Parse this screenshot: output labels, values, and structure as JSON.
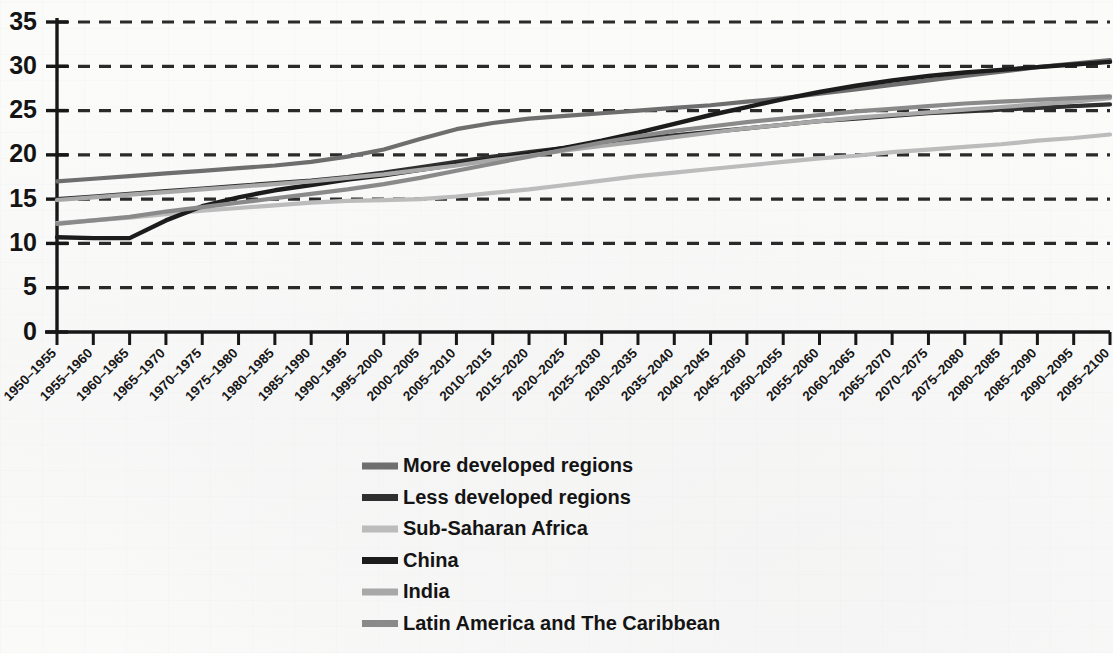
{
  "chart_data": {
    "type": "line",
    "title": "",
    "xlabel": "",
    "ylabel": "",
    "ylim": [
      0,
      35
    ],
    "ytick_step": 5,
    "grid": true,
    "grid_style": "dashed-horizontal",
    "legend_position": "below-plot-center",
    "yticks": [
      "0",
      "5",
      "10",
      "15",
      "20",
      "25",
      "30",
      "35"
    ],
    "categories": [
      "1950–1955",
      "1955–1960",
      "1960–1965",
      "1965–1970",
      "1970–1975",
      "1975–1980",
      "1980–1985",
      "1985–1990",
      "1990–1995",
      "1995–2000",
      "2000–2005",
      "2005–2010",
      "2010–2015",
      "2015–2020",
      "2020–2025",
      "2025–2030",
      "2030–2035",
      "2035–2040",
      "2040–2045",
      "2045–2050",
      "2050–2055",
      "2055–2060",
      "2060–2065",
      "2065–2070",
      "2070–2075",
      "2075–2080",
      "2080–2085",
      "2085–2090",
      "2090–2095",
      "2095–2100"
    ],
    "series": [
      {
        "name": "More developed regions",
        "color": "#6e6e6e",
        "width": 4.2,
        "values": [
          17.0,
          17.3,
          17.6,
          17.9,
          18.2,
          18.5,
          18.8,
          19.2,
          19.8,
          20.6,
          21.8,
          22.9,
          23.6,
          24.1,
          24.4,
          24.7,
          25.0,
          25.3,
          25.6,
          26.0,
          26.4,
          26.9,
          27.4,
          27.9,
          28.4,
          28.9,
          29.4,
          29.9,
          30.3,
          30.7
        ]
      },
      {
        "name": "Less developed regions",
        "color": "#2f2f2f",
        "width": 4.2,
        "values": [
          15.0,
          15.3,
          15.6,
          15.9,
          16.2,
          16.5,
          16.8,
          17.1,
          17.5,
          18.0,
          18.6,
          19.2,
          19.8,
          20.3,
          20.8,
          21.3,
          21.8,
          22.2,
          22.6,
          23.0,
          23.4,
          23.8,
          24.1,
          24.4,
          24.7,
          24.9,
          25.1,
          25.3,
          25.5,
          25.7
        ]
      },
      {
        "name": "Sub-Saharan Africa",
        "color": "#bcbcbc",
        "width": 4.2,
        "values": [
          12.3,
          12.6,
          12.9,
          13.3,
          13.7,
          14.0,
          14.3,
          14.6,
          14.8,
          14.9,
          15.0,
          15.3,
          15.7,
          16.1,
          16.6,
          17.1,
          17.6,
          18.0,
          18.4,
          18.8,
          19.2,
          19.6,
          19.9,
          20.3,
          20.6,
          20.9,
          21.2,
          21.6,
          21.9,
          22.3
        ]
      },
      {
        "name": "China",
        "color": "#1c1c1c",
        "width": 4.4,
        "values": [
          10.7,
          10.6,
          10.6,
          12.6,
          14.2,
          15.2,
          16.0,
          16.6,
          17.2,
          17.7,
          18.3,
          18.9,
          19.5,
          20.1,
          20.8,
          21.6,
          22.5,
          23.5,
          24.5,
          25.4,
          26.3,
          27.1,
          27.8,
          28.4,
          28.9,
          29.3,
          29.6,
          29.9,
          30.2,
          30.5
        ]
      },
      {
        "name": "India",
        "color": "#a8a8a8",
        "width": 4.2,
        "values": [
          14.9,
          15.2,
          15.5,
          15.8,
          16.1,
          16.4,
          16.7,
          17.0,
          17.4,
          17.8,
          18.3,
          18.8,
          19.4,
          19.9,
          20.5,
          21.0,
          21.5,
          22.0,
          22.5,
          23.0,
          23.4,
          23.8,
          24.2,
          24.5,
          24.8,
          25.1,
          25.4,
          25.7,
          26.0,
          26.4
        ]
      },
      {
        "name": "Latin America and The Caribbean",
        "color": "#8a8a8a",
        "width": 4.2,
        "values": [
          12.2,
          12.6,
          13.0,
          13.6,
          14.1,
          14.6,
          15.1,
          15.6,
          16.1,
          16.7,
          17.4,
          18.2,
          19.0,
          19.8,
          20.6,
          21.4,
          22.1,
          22.7,
          23.2,
          23.7,
          24.1,
          24.5,
          24.9,
          25.2,
          25.5,
          25.8,
          26.0,
          26.2,
          26.4,
          26.6
        ]
      }
    ]
  },
  "legend": {
    "items": [
      {
        "label": "More developed regions",
        "color": "#6e6e6e"
      },
      {
        "label": "Less developed regions",
        "color": "#2f2f2f"
      },
      {
        "label": "Sub-Saharan Africa",
        "color": "#bcbcbc"
      },
      {
        "label": "China",
        "color": "#1c1c1c"
      },
      {
        "label": "India",
        "color": "#a8a8a8"
      },
      {
        "label": "Latin America and The Caribbean",
        "color": "#8a8a8a"
      }
    ]
  },
  "axis": {
    "axis_color": "#171717",
    "grid_color": "#2a2a2a"
  }
}
